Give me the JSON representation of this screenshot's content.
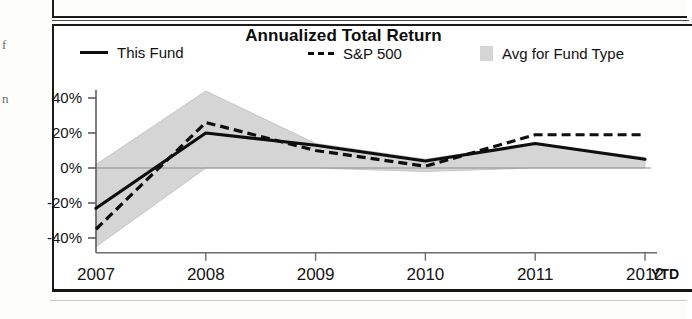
{
  "panel": {
    "title": "Annualized Total Return"
  },
  "marginalia": {
    "line1": "f",
    "line2": "n"
  },
  "legend": {
    "items": [
      {
        "label": "This Fund",
        "marker": "solid-line-swatch",
        "color": "#0e0e0e"
      },
      {
        "label": "S&P 500",
        "marker": "dashed-line-swatch",
        "color": "#0e0e0e"
      },
      {
        "label": "Avg for Fund Type",
        "marker": "band-swatch",
        "color": "#d5d5d5"
      }
    ]
  },
  "axis": {
    "x_suffix_label": "YTD",
    "y_ticks": [
      "40%",
      "20%",
      "0%",
      "-20%",
      "-40%"
    ],
    "x_ticks": [
      "2007",
      "2008",
      "2009",
      "2010",
      "2011",
      "2012"
    ]
  },
  "chart_data": {
    "type": "line",
    "title": "Annualized Total Return",
    "xlabel": "",
    "ylabel": "",
    "x": [
      "2007",
      "2008",
      "2009",
      "2010",
      "2011",
      "2012"
    ],
    "categories": [
      "2007",
      "2008",
      "2009",
      "2010",
      "2011",
      "2012"
    ],
    "ylim": [
      -45,
      45
    ],
    "yticks": [
      -40,
      -20,
      0,
      20,
      40
    ],
    "ytick_labels": [
      "-40%",
      "-20%",
      "0%",
      "20%",
      "40%"
    ],
    "grid": false,
    "zero_line": true,
    "legend_position": "top",
    "series": [
      {
        "name": "This Fund",
        "style": "solid",
        "color": "#0e0e0e",
        "values": [
          -23,
          20,
          13,
          4,
          14,
          5
        ]
      },
      {
        "name": "S&P 500",
        "style": "dashed",
        "color": "#0e0e0e",
        "values": [
          -35,
          26,
          10,
          1,
          19,
          19
        ]
      },
      {
        "name": "Avg for Fund Type",
        "style": "band",
        "color": "#d5d5d5",
        "upper": [
          2,
          44,
          14,
          5,
          14,
          6
        ],
        "lower": [
          -45,
          0,
          0,
          -2,
          0,
          0
        ]
      }
    ]
  }
}
